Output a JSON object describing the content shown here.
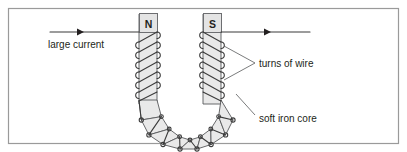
{
  "figure": {
    "frame_color": "#9a9a9a",
    "background": "#ffffff",
    "ink_color": "#231f20",
    "core_fill": "#e9e9e9",
    "core_stroke": "#58595b",
    "pole_box_fill": "#e4e4e4",
    "pole_box_stroke": "#6d6e71",
    "wire_color": "#3b3b3b"
  },
  "poles": {
    "north": "N",
    "south": "S"
  },
  "labels": {
    "current": "large current",
    "turns": "turns of wire",
    "core": "soft iron core"
  },
  "arrows": {
    "left_arrow_name": "current-direction-arrow-left",
    "right_arrow_name": "current-direction-arrow-right",
    "direction": "right"
  },
  "diagram_data": {
    "type": "schematic",
    "components": [
      {
        "name": "soft-iron-core",
        "shape": "U-shaped bar",
        "fill": "#e9e9e9"
      },
      {
        "name": "wire-coil",
        "shape": "helical winding around both limbs and bend"
      },
      {
        "name": "north-pole-label",
        "text": "N",
        "position": "top-left-limb"
      },
      {
        "name": "south-pole-label",
        "text": "S",
        "position": "top-right-limb"
      },
      {
        "name": "current-lead-in",
        "text": "large current",
        "position": "left"
      },
      {
        "name": "current-lead-out",
        "position": "right"
      }
    ],
    "leader_lines": [
      {
        "label": "turns of wire",
        "targets": 2
      },
      {
        "label": "soft iron core",
        "targets": 1
      }
    ]
  }
}
